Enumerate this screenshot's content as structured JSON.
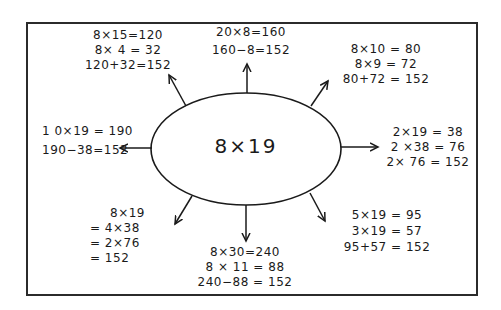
{
  "diagram": {
    "center": {
      "text": "8×19"
    },
    "branches": [
      {
        "id": "top-left",
        "lines": [
          "8×15=120",
          "8× 4 = 32",
          "120+32=152"
        ]
      },
      {
        "id": "top",
        "lines": [
          "20×8=160",
          "160−8=152"
        ]
      },
      {
        "id": "top-right",
        "lines": [
          "8×10 = 80",
          "8×9 = 72",
          "80+72 = 152"
        ]
      },
      {
        "id": "left",
        "lines": [
          "1 0×19 = 190",
          "190−38=152"
        ]
      },
      {
        "id": "right",
        "lines": [
          "2×19 = 38",
          "2 ×38 = 76",
          "2× 76 = 152"
        ]
      },
      {
        "id": "bottom-left",
        "lines": [
          "8×19",
          "= 4×38",
          "= 2×76",
          "= 152"
        ]
      },
      {
        "id": "bottom",
        "lines": [
          "8×30=240",
          "8 × 11 = 88",
          "240−88 = 152"
        ]
      },
      {
        "id": "bottom-right",
        "lines": [
          "5×19 = 95",
          "3×19 = 57",
          "95+57 = 152"
        ]
      }
    ],
    "colors": {
      "ink": "#1a1a1a",
      "background": "#ffffff",
      "frame": "#2b2b2b"
    }
  }
}
